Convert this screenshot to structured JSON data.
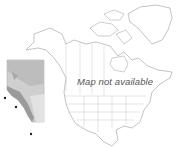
{
  "map": {
    "message": "Map not available",
    "inset_region": "Alberta",
    "occurrence_points": [
      {
        "x": 5,
        "y": 98
      },
      {
        "x": 16,
        "y": 107
      },
      {
        "x": 31,
        "y": 134
      }
    ],
    "colors": {
      "outline": "#9a9a9a",
      "inset_light": "#d6d6d6",
      "inset_mid": "#b8b8b8",
      "inset_dark": "#8e8e8e",
      "point": "#222222"
    }
  }
}
